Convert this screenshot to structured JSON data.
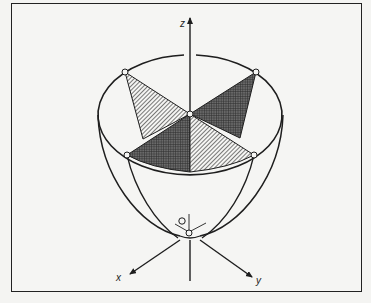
{
  "figure": {
    "type": "3d-surface-diagram",
    "axes": {
      "x_label": "x",
      "y_label": "y",
      "z_label": "z"
    },
    "colors": {
      "stroke": "#1e1e1e",
      "background": "#f5f5f3",
      "frame": "#222222"
    },
    "rim_points": 4,
    "center_point": true,
    "vertex_marker": true
  }
}
